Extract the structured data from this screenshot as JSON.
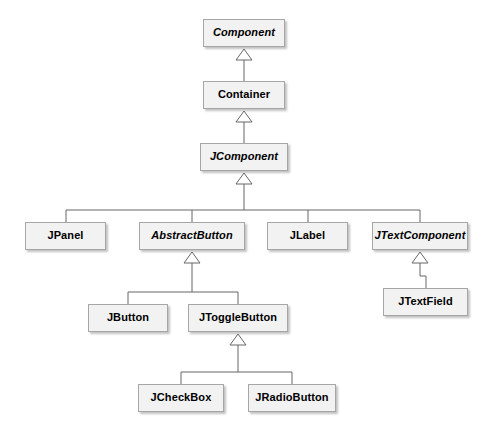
{
  "diagram": {
    "kind": "uml-class-hierarchy",
    "style": {
      "box_fill": "#f2f2f2",
      "box_border": "#a6a6a6",
      "shadow": "#787878",
      "edge_color": "#666666",
      "text_color": "#000000",
      "background": "#ffffff"
    },
    "relationship": "generalization",
    "arrowhead": "hollow-triangle",
    "nodes": [
      {
        "id": "component",
        "label": "Component",
        "abstract": true,
        "x": 203,
        "y": 19,
        "w": 82,
        "h": 28
      },
      {
        "id": "container",
        "label": "Container",
        "abstract": false,
        "x": 203,
        "y": 81,
        "w": 82,
        "h": 28
      },
      {
        "id": "jcomponent",
        "label": "JComponent",
        "abstract": true,
        "x": 200,
        "y": 143,
        "w": 88,
        "h": 28
      },
      {
        "id": "jpanel",
        "label": "JPanel",
        "abstract": false,
        "x": 25,
        "y": 222,
        "w": 81,
        "h": 28
      },
      {
        "id": "abstractbutton",
        "label": "AbstractButton",
        "abstract": true,
        "x": 139,
        "y": 222,
        "w": 106,
        "h": 28
      },
      {
        "id": "jlabel",
        "label": "JLabel",
        "abstract": false,
        "x": 267,
        "y": 222,
        "w": 81,
        "h": 28
      },
      {
        "id": "jtextcomponent",
        "label": "JTextComponent",
        "abstract": true,
        "x": 372,
        "y": 222,
        "w": 96,
        "h": 28
      },
      {
        "id": "jbutton",
        "label": "JButton",
        "abstract": false,
        "x": 88,
        "y": 304,
        "w": 80,
        "h": 28
      },
      {
        "id": "jtogglebutton",
        "label": "JToggleButton",
        "abstract": false,
        "x": 188,
        "y": 304,
        "w": 100,
        "h": 28
      },
      {
        "id": "jtextfield",
        "label": "JTextField",
        "abstract": false,
        "x": 383,
        "y": 288,
        "w": 85,
        "h": 28
      },
      {
        "id": "jcheckbox",
        "label": "JCheckBox",
        "abstract": false,
        "x": 138,
        "y": 384,
        "w": 86,
        "h": 28
      },
      {
        "id": "jradiobutton",
        "label": "JRadioButton",
        "abstract": false,
        "x": 248,
        "y": 384,
        "w": 88,
        "h": 28
      }
    ],
    "edges": [
      {
        "from": "container",
        "to": "component"
      },
      {
        "from": "jcomponent",
        "to": "container"
      },
      {
        "from": "jpanel",
        "to": "jcomponent"
      },
      {
        "from": "abstractbutton",
        "to": "jcomponent"
      },
      {
        "from": "jlabel",
        "to": "jcomponent"
      },
      {
        "from": "jtextcomponent",
        "to": "jcomponent"
      },
      {
        "from": "jbutton",
        "to": "abstractbutton"
      },
      {
        "from": "jtogglebutton",
        "to": "abstractbutton"
      },
      {
        "from": "jtextfield",
        "to": "jtextcomponent"
      },
      {
        "from": "jcheckbox",
        "to": "jtogglebutton"
      },
      {
        "from": "jradiobutton",
        "to": "jtogglebutton"
      }
    ]
  }
}
